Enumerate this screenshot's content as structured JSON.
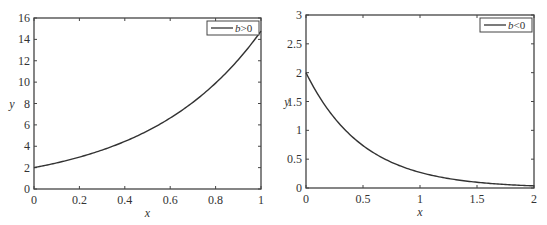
{
  "chart_data": [
    {
      "type": "line",
      "title": "",
      "xlabel": "x",
      "ylabel": "y",
      "xlim": [
        0,
        1
      ],
      "ylim": [
        0,
        16
      ],
      "xticks": [
        0,
        0.2,
        0.4,
        0.6,
        0.8,
        1
      ],
      "xtick_labels": [
        "0",
        "0.2",
        "0.4",
        "0.6",
        "0.8",
        "1"
      ],
      "yticks": [
        0,
        2,
        4,
        6,
        8,
        10,
        12,
        14,
        16
      ],
      "ytick_labels": [
        "0",
        "2",
        "4",
        "6",
        "8",
        "10",
        "12",
        "14",
        "16"
      ],
      "grid": false,
      "legend_position": "upper right",
      "series": [
        {
          "name": "b>0",
          "x": [
            0,
            0.1,
            0.2,
            0.3,
            0.4,
            0.5,
            0.6,
            0.7,
            0.8,
            0.9,
            1.0
          ],
          "values": [
            2.0,
            2.44,
            2.98,
            3.64,
            4.45,
            5.44,
            6.64,
            8.11,
            9.91,
            12.1,
            14.78
          ]
        }
      ]
    },
    {
      "type": "line",
      "title": "",
      "xlabel": "x",
      "ylabel": "y",
      "xlim": [
        0,
        2
      ],
      "ylim": [
        0,
        3
      ],
      "xticks": [
        0,
        0.5,
        1,
        1.5,
        2
      ],
      "xtick_labels": [
        "0",
        "0.5",
        "1",
        "1.5",
        "2"
      ],
      "yticks": [
        0,
        0.5,
        1,
        1.5,
        2,
        2.5,
        3
      ],
      "ytick_labels": [
        "0",
        "0.5",
        "1",
        "1.5",
        "2",
        "2.5",
        "3"
      ],
      "grid": false,
      "legend_position": "upper right",
      "series": [
        {
          "name": "b<0",
          "x": [
            0,
            0.1,
            0.2,
            0.3,
            0.4,
            0.5,
            0.6,
            0.7,
            0.8,
            0.9,
            1.0,
            1.2,
            1.4,
            1.6,
            1.8,
            2.0
          ],
          "values": [
            2.0,
            1.64,
            1.34,
            1.1,
            0.9,
            0.74,
            0.6,
            0.49,
            0.4,
            0.33,
            0.27,
            0.18,
            0.12,
            0.08,
            0.05,
            0.04
          ]
        }
      ]
    }
  ],
  "plots": [
    {
      "legend": "b>0",
      "xlabel": "x",
      "ylabel": "y"
    },
    {
      "legend": "b<0",
      "xlabel": "x",
      "ylabel": "y"
    }
  ]
}
